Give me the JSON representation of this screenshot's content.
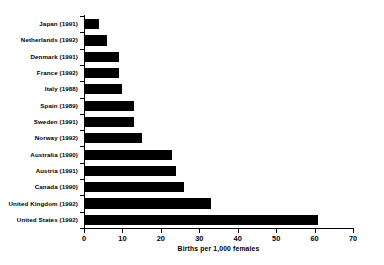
{
  "chart_data": {
    "type": "bar",
    "orientation": "horizontal",
    "title": "",
    "xlabel": "Births per 1,000 females",
    "ylabel": "",
    "xlim": [
      0,
      70
    ],
    "xticks": [
      0,
      10,
      20,
      30,
      40,
      50,
      60,
      70
    ],
    "grid": false,
    "legend": null,
    "bar_color": "#000000",
    "axis_color": "#000000",
    "background": "#ffffff",
    "categories": [
      "Japan (1991)",
      "Netherlands (1992)",
      "Denmark (1991)",
      "France (1992)",
      "Italy (1988)",
      "Spain (1989)",
      "Sweden (1991)",
      "Norway (1992)",
      "Australia (1990)",
      "Austria (1991)",
      "Canada (1990)",
      "United Kingdom (1992)",
      "United States (1992)"
    ],
    "values": [
      4,
      6,
      9,
      9,
      10,
      13,
      13,
      15,
      23,
      24,
      26,
      33,
      61
    ]
  }
}
